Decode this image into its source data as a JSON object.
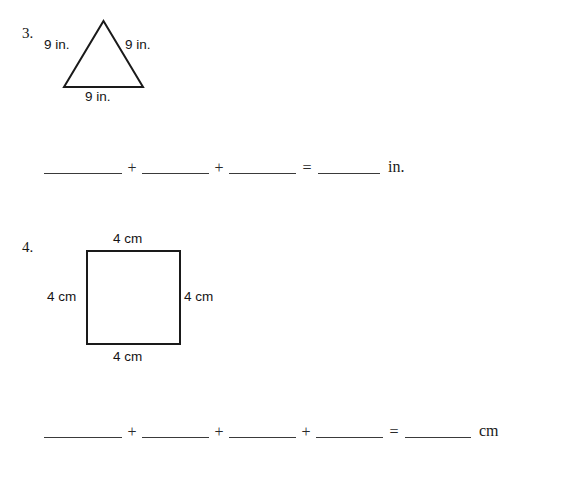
{
  "page": {
    "background_color": "#ffffff",
    "ink_color": "#1a1a1a"
  },
  "problems": [
    {
      "number": "3.",
      "shape": "triangle",
      "labels": {
        "left": "9 in.",
        "right": "9 in.",
        "bottom": "9 in."
      },
      "equation": {
        "blank_count": 3,
        "operators": [
          "+",
          "+"
        ],
        "equals": "=",
        "result_unit": "in."
      }
    },
    {
      "number": "4.",
      "shape": "square",
      "labels": {
        "top": "4 cm",
        "left": "4 cm",
        "right": "4 cm",
        "bottom": "4 cm"
      },
      "equation": {
        "blank_count": 4,
        "operators": [
          "+",
          "+",
          "+"
        ],
        "equals": "=",
        "result_unit": "cm"
      }
    }
  ]
}
